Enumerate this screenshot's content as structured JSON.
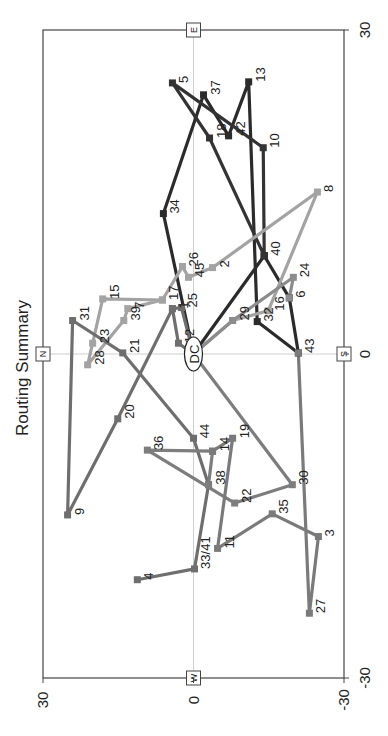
{
  "chart_data": {
    "type": "line",
    "title": "Routing Summary",
    "orientation": "rotated -90deg (text reads bottom-to-top)",
    "xlabel": "",
    "ylabel": "",
    "xlim": [
      -30,
      30
    ],
    "ylim": [
      -30,
      30
    ],
    "x_ticks": [
      "-30",
      "0",
      "30"
    ],
    "y_ticks": [
      "-30",
      "0",
      "30"
    ],
    "grid": "center crosshair only",
    "compass": {
      "N": "N",
      "S": "S",
      "E": "E",
      "W": "W"
    },
    "depot": {
      "label": "DC",
      "x": 0,
      "y": 0
    },
    "points": [
      {
        "id": "1",
        "x": 4.2,
        "y": 4.2
      },
      {
        "id": "2",
        "x": 8.0,
        "y": -3.8
      },
      {
        "id": "3",
        "x": -16.9,
        "y": -24.9
      },
      {
        "id": "4",
        "x": -20.9,
        "y": 11.2
      },
      {
        "id": "5",
        "x": 25.1,
        "y": 4.2
      },
      {
        "id": "6",
        "x": 5.2,
        "y": -19.1
      },
      {
        "id": "7",
        "x": 4.2,
        "y": 13.1
      },
      {
        "id": "8",
        "x": 15.0,
        "y": -24.7
      },
      {
        "id": "9",
        "x": -14.9,
        "y": 25.1
      },
      {
        "id": "10",
        "x": 19.1,
        "y": -13.9
      },
      {
        "id": "11",
        "x": -18.0,
        "y": -4.8
      },
      {
        "id": "12",
        "x": 1.0,
        "y": 3.0
      },
      {
        "id": "13",
        "x": 25.2,
        "y": -11.0
      },
      {
        "id": "14",
        "x": -9.0,
        "y": -3.8
      },
      {
        "id": "15",
        "x": 5.1,
        "y": 18.1
      },
      {
        "id": "16",
        "x": 4.0,
        "y": -14.9
      },
      {
        "id": "17",
        "x": 5.0,
        "y": 6.2
      },
      {
        "id": "18",
        "x": 20.0,
        "y": -3.2
      },
      {
        "id": "19",
        "x": -7.8,
        "y": -7.8
      },
      {
        "id": "20",
        "x": -6.0,
        "y": 15.1
      },
      {
        "id": "21",
        "x": 0.1,
        "y": 14.1
      },
      {
        "id": "22",
        "x": -13.8,
        "y": -8.2
      },
      {
        "id": "23",
        "x": 1.0,
        "y": 20.1
      },
      {
        "id": "24",
        "x": 7.1,
        "y": -19.9
      },
      {
        "id": "25",
        "x": 4.3,
        "y": 2.4
      },
      {
        "id": "26",
        "x": 8.1,
        "y": 2.2
      },
      {
        "id": "27",
        "x": -24.0,
        "y": -23.1
      },
      {
        "id": "28",
        "x": -1.0,
        "y": 21.1
      },
      {
        "id": "29",
        "x": 3.1,
        "y": -7.8
      },
      {
        "id": "30",
        "x": -12.1,
        "y": -19.7
      },
      {
        "id": "31",
        "x": 3.1,
        "y": 24.1
      },
      {
        "id": "32",
        "x": 3.0,
        "y": -12.7
      },
      {
        "id": "33/41",
        "x": -19.9,
        "y": -0.2
      },
      {
        "id": "34",
        "x": 13.0,
        "y": 6.0
      },
      {
        "id": "35",
        "x": -14.8,
        "y": -15.7
      },
      {
        "id": "36",
        "x": -8.9,
        "y": 9.2
      },
      {
        "id": "37",
        "x": 24.0,
        "y": -2.0
      },
      {
        "id": "38",
        "x": -12.1,
        "y": -3.0
      },
      {
        "id": "39",
        "x": 3.1,
        "y": 13.9
      },
      {
        "id": "40",
        "x": 9.1,
        "y": -14.1
      },
      {
        "id": "42",
        "x": 20.2,
        "y": -7.0
      },
      {
        "id": "43",
        "x": 0.1,
        "y": -20.9
      },
      {
        "id": "44",
        "x": -7.8,
        "y": 0.0
      },
      {
        "id": "45",
        "x": 7.1,
        "y": 1.0
      }
    ],
    "series": [
      {
        "name": "Route 1",
        "color": "#2b2b2b",
        "stops": [
          "DC",
          "34",
          "37",
          "42",
          "13",
          "32",
          "43",
          "6",
          "40",
          "DC"
        ]
      },
      {
        "name": "Route 2",
        "color": "#333333",
        "stops": [
          "40",
          "18",
          "5",
          "10",
          "40"
        ]
      },
      {
        "name": "Route 3",
        "color": "#a3a3a3",
        "stops": [
          "DC",
          "29",
          "16",
          "8",
          "2",
          "45",
          "26",
          "17",
          "15",
          "23",
          "28",
          "39",
          "7",
          "17"
        ]
      },
      {
        "name": "Route 4",
        "color": "#8c8c8c",
        "stops": [
          "DC",
          "29",
          "24",
          "6"
        ]
      },
      {
        "name": "Route 5",
        "color": "#6e6e6e",
        "stops": [
          "DC",
          "12",
          "1",
          "20",
          "9",
          "31",
          "21",
          "44",
          "38",
          "33/41",
          "4"
        ]
      },
      {
        "name": "Route 6",
        "color": "#7d7d7d",
        "stops": [
          "DC",
          "30",
          "22",
          "36",
          "14",
          "38"
        ]
      },
      {
        "name": "Route 7",
        "color": "#7a7a7a",
        "stops": [
          "43",
          "27",
          "3",
          "35",
          "11",
          "19",
          "14"
        ]
      },
      {
        "name": "Route 8",
        "color": "#6e6e6e",
        "stops": [
          "DC",
          "25",
          "1"
        ]
      }
    ]
  }
}
